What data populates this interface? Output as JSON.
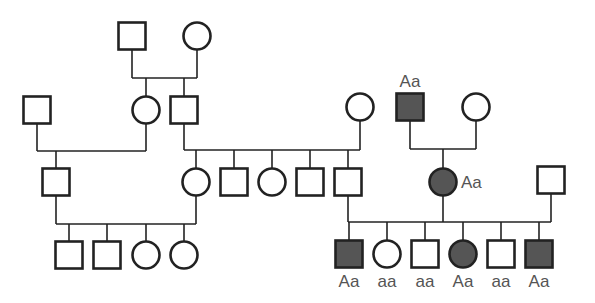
{
  "diagram": {
    "type": "pedigree",
    "colors": {
      "line": "#222222",
      "affected_fill": "#555555",
      "unaffected_fill": "#ffffff",
      "label": "#555555"
    },
    "individuals": [
      {
        "id": "I-1",
        "sex": "male",
        "affected": false,
        "cx": 132,
        "cy": 36,
        "label": ""
      },
      {
        "id": "I-2",
        "sex": "female",
        "affected": false,
        "cx": 197,
        "cy": 36,
        "label": ""
      },
      {
        "id": "II-1",
        "sex": "male",
        "affected": false,
        "cx": 37,
        "cy": 110,
        "label": ""
      },
      {
        "id": "II-2",
        "sex": "female",
        "affected": false,
        "cx": 146,
        "cy": 110,
        "label": ""
      },
      {
        "id": "II-3",
        "sex": "male",
        "affected": false,
        "cx": 184,
        "cy": 110,
        "label": ""
      },
      {
        "id": "II-4",
        "sex": "female",
        "affected": false,
        "cx": 360,
        "cy": 107,
        "label": ""
      },
      {
        "id": "II-5",
        "sex": "male",
        "affected": true,
        "cx": 410,
        "cy": 107,
        "label": "Aa",
        "label_pos": "above"
      },
      {
        "id": "II-6",
        "sex": "female",
        "affected": false,
        "cx": 476,
        "cy": 107,
        "label": ""
      },
      {
        "id": "III-1",
        "sex": "male",
        "affected": false,
        "cx": 56,
        "cy": 182,
        "label": ""
      },
      {
        "id": "III-2",
        "sex": "female",
        "affected": false,
        "cx": 196,
        "cy": 182,
        "label": ""
      },
      {
        "id": "III-3",
        "sex": "male",
        "affected": false,
        "cx": 234,
        "cy": 182,
        "label": ""
      },
      {
        "id": "III-4",
        "sex": "female",
        "affected": false,
        "cx": 272,
        "cy": 182,
        "label": ""
      },
      {
        "id": "III-5",
        "sex": "male",
        "affected": false,
        "cx": 310,
        "cy": 182,
        "label": ""
      },
      {
        "id": "III-6",
        "sex": "male",
        "affected": false,
        "cx": 348,
        "cy": 182,
        "label": ""
      },
      {
        "id": "III-7",
        "sex": "female",
        "affected": true,
        "cx": 443,
        "cy": 182,
        "label": "Aa",
        "label_pos": "right"
      },
      {
        "id": "III-8",
        "sex": "male",
        "affected": false,
        "cx": 551,
        "cy": 180,
        "label": ""
      },
      {
        "id": "IV-1",
        "sex": "male",
        "affected": false,
        "cx": 69,
        "cy": 255,
        "label": ""
      },
      {
        "id": "IV-2",
        "sex": "male",
        "affected": false,
        "cx": 107,
        "cy": 255,
        "label": ""
      },
      {
        "id": "IV-3",
        "sex": "female",
        "affected": false,
        "cx": 146,
        "cy": 255,
        "label": ""
      },
      {
        "id": "IV-4",
        "sex": "female",
        "affected": false,
        "cx": 184,
        "cy": 255,
        "label": ""
      },
      {
        "id": "IV-5",
        "sex": "male",
        "affected": true,
        "cx": 349,
        "cy": 254,
        "label": "Aa",
        "label_pos": "below"
      },
      {
        "id": "IV-6",
        "sex": "female",
        "affected": false,
        "cx": 387,
        "cy": 254,
        "label": "aa",
        "label_pos": "below"
      },
      {
        "id": "IV-7",
        "sex": "male",
        "affected": false,
        "cx": 425,
        "cy": 254,
        "label": "aa",
        "label_pos": "below"
      },
      {
        "id": "IV-8",
        "sex": "female",
        "affected": true,
        "cx": 463,
        "cy": 254,
        "label": "Aa",
        "label_pos": "below"
      },
      {
        "id": "IV-9",
        "sex": "male",
        "affected": false,
        "cx": 501,
        "cy": 254,
        "label": "aa",
        "label_pos": "below"
      },
      {
        "id": "IV-10",
        "sex": "male",
        "affected": true,
        "cx": 539,
        "cy": 254,
        "label": "Aa",
        "label_pos": "below"
      }
    ],
    "lines": [
      [
        132,
        50,
        132,
        78
      ],
      [
        197,
        49,
        197,
        78
      ],
      [
        132,
        78,
        197,
        78
      ],
      [
        146,
        78,
        146,
        97
      ],
      [
        184,
        78,
        184,
        96
      ],
      [
        37,
        123,
        37,
        151
      ],
      [
        146,
        123,
        146,
        151
      ],
      [
        37,
        151,
        146,
        151
      ],
      [
        56,
        151,
        56,
        168
      ],
      [
        184,
        123,
        184,
        150
      ],
      [
        360,
        120,
        360,
        150
      ],
      [
        184,
        150,
        360,
        150
      ],
      [
        196,
        150,
        196,
        169
      ],
      [
        234,
        150,
        234,
        168
      ],
      [
        272,
        150,
        272,
        169
      ],
      [
        310,
        150,
        310,
        168
      ],
      [
        348,
        150,
        348,
        168
      ],
      [
        410,
        121,
        410,
        149
      ],
      [
        476,
        120,
        476,
        149
      ],
      [
        410,
        149,
        476,
        149
      ],
      [
        443,
        149,
        443,
        169
      ],
      [
        56,
        196,
        56,
        224
      ],
      [
        196,
        195,
        196,
        224
      ],
      [
        56,
        224,
        196,
        224
      ],
      [
        69,
        224,
        69,
        241
      ],
      [
        107,
        224,
        107,
        241
      ],
      [
        146,
        224,
        146,
        242
      ],
      [
        184,
        224,
        184,
        242
      ],
      [
        348,
        196,
        348,
        222
      ],
      [
        551,
        194,
        551,
        222
      ],
      [
        348,
        222,
        551,
        222
      ],
      [
        443,
        195,
        443,
        222
      ],
      [
        349,
        222,
        349,
        240
      ],
      [
        387,
        222,
        387,
        241
      ],
      [
        425,
        222,
        425,
        240
      ],
      [
        463,
        222,
        463,
        241
      ],
      [
        501,
        222,
        501,
        240
      ],
      [
        539,
        222,
        539,
        240
      ]
    ]
  }
}
